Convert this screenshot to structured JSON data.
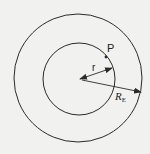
{
  "diagram": {
    "type": "concentric-circles",
    "labels": {
      "point": "P",
      "inner_radius": "r",
      "outer_radius": "R",
      "outer_radius_subscript": "E"
    },
    "colors": {
      "background": "#f1f1ef",
      "stroke": "#2a2a2a"
    }
  }
}
